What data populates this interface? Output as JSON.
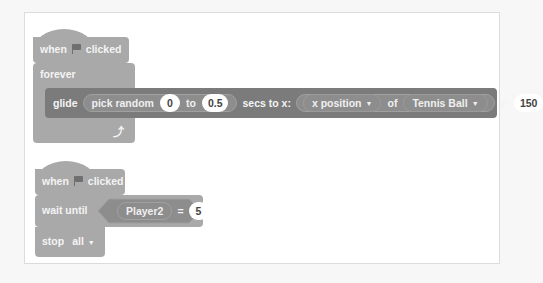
{
  "script1": {
    "hat": {
      "when": "when",
      "flag_icon": "green-flag-icon",
      "clicked": "clicked"
    },
    "forever": {
      "label": "forever",
      "loop_icon": "loop-arrow-icon"
    },
    "glide": {
      "label": "glide",
      "pick_random": "pick random",
      "from": "0",
      "to_label": "to",
      "to": "0.5",
      "secs_to_x": "secs to x:",
      "attribute": "x position",
      "of_label": "of",
      "sprite": "Tennis Ball",
      "y_label": "y:",
      "y": "150"
    }
  },
  "script2": {
    "hat": {
      "when": "when",
      "flag_icon": "green-flag-icon",
      "clicked": "clicked"
    },
    "wait_until": {
      "label": "wait until",
      "variable": "Player2",
      "op": "=",
      "value": "5"
    },
    "stop": {
      "label": "stop",
      "option": "all"
    }
  },
  "colors": {
    "block_light": "#a9a9a9",
    "block_dark": "#7b7b7b",
    "reporter": "#8d8d8d",
    "input": "#ffffff",
    "canvas": "#ffffff"
  }
}
